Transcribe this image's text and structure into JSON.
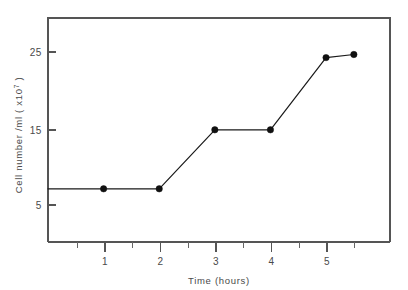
{
  "chart_data": {
    "type": "line",
    "title": "",
    "xlabel": "Time (hours)",
    "ylabel": "Cell number /ml ( x10",
    "ylabel_superscript": "7",
    "ylabel_suffix": " )",
    "x": [
      0,
      1,
      2,
      3,
      4,
      5,
      5.5
    ],
    "values": [
      7.3,
      7.3,
      7.3,
      14.9,
      14.9,
      24.2,
      24.6
    ],
    "markers_at_x": [
      1,
      2,
      3,
      4,
      5,
      5.5
    ],
    "series": [
      {
        "name": "Cell number",
        "points": [
          {
            "x": 0,
            "y": 7.3,
            "marker": false
          },
          {
            "x": 1,
            "y": 7.3,
            "marker": true
          },
          {
            "x": 2,
            "y": 7.3,
            "marker": true
          },
          {
            "x": 3,
            "y": 14.9,
            "marker": true
          },
          {
            "x": 4,
            "y": 14.9,
            "marker": true
          },
          {
            "x": 5,
            "y": 24.2,
            "marker": true
          },
          {
            "x": 5.5,
            "y": 24.6,
            "marker": true
          }
        ]
      }
    ],
    "xlim": [
      0,
      6.15
    ],
    "ylim": [
      0.45,
      29.3
    ],
    "xticks_major": [
      1,
      2,
      3,
      4,
      5
    ],
    "xticks_major_labels": [
      "1",
      "2",
      "3",
      "4",
      "5"
    ],
    "xticks_minor": [
      0.5,
      1.5,
      2.5,
      3.5,
      4.5,
      5.5
    ],
    "yticks_major": [
      5,
      15,
      25
    ],
    "yticks_major_labels": [
      "5",
      "15",
      "25"
    ],
    "grid": false,
    "legend": "none",
    "marker_style": "filled-circle",
    "line_color": "#1a1a1a",
    "axis_color": "#555555",
    "text_color": "#4a4a4a",
    "background_color": "#ffffff"
  },
  "axes": {
    "x_title": "Time (hours)",
    "y_title_main": "Cell number /ml ( x10",
    "y_title_sup": "7",
    "y_title_end": " )"
  },
  "tick_labels": {
    "y": [
      "25",
      "15",
      "5"
    ],
    "x": [
      "1",
      "2",
      "3",
      "4",
      "5"
    ]
  }
}
